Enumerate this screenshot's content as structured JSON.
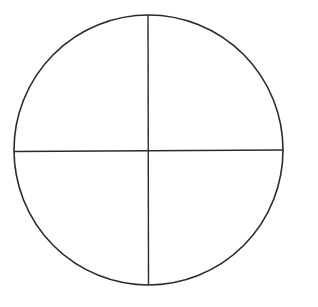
{
  "diagram": {
    "type": "circle-divided-into-quadrants",
    "shape": "circle",
    "divisions": 4,
    "center": {
      "x": 148.5,
      "y": 150.5
    },
    "radius": 134.5,
    "lines": [
      {
        "orientation": "vertical",
        "x1": 148,
        "y1": 15,
        "x2": 148.5,
        "y2": 285
      },
      {
        "orientation": "horizontal",
        "x1": 14,
        "y1": 151.5,
        "x2": 283,
        "y2": 150
      }
    ],
    "stroke_color": "#2a2a2a",
    "background_color": "#ffffff"
  }
}
